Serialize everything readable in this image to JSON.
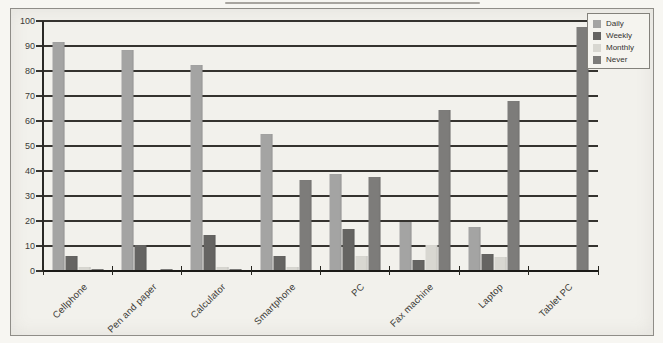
{
  "chart_data": {
    "type": "bar",
    "title": "",
    "xlabel": "",
    "ylabel": "",
    "categories": [
      "Cellphone",
      "Pen and paper",
      "Calculator",
      "Smartphone",
      "PC",
      "Fax machine",
      "Laptop",
      "Tablet PC"
    ],
    "series": [
      {
        "name": "Daily",
        "color": "#a4a4a3",
        "values": [
          91.5,
          88.5,
          82.5,
          55,
          39,
          19.5,
          17.5,
          0.5
        ]
      },
      {
        "name": "Weekly",
        "color": "#656462",
        "values": [
          6,
          10.5,
          14.5,
          6,
          17,
          4.5,
          7,
          0.5
        ]
      },
      {
        "name": "Monthly",
        "color": "#d8d7d1",
        "values": [
          1.5,
          0.5,
          1.5,
          1.5,
          6,
          10.5,
          5.5,
          0.5
        ]
      },
      {
        "name": "Never",
        "color": "#7d7c7a",
        "values": [
          1,
          1,
          1,
          36.5,
          37.5,
          64.5,
          68,
          97.5
        ]
      }
    ],
    "ylim": [
      0,
      100
    ],
    "yticks": [
      0,
      10,
      20,
      30,
      40,
      50,
      60,
      70,
      80,
      90,
      100
    ],
    "grid": true,
    "legend_position": "top-right",
    "legend_entries": [
      "Daily",
      "Weekly",
      "Monthly",
      "Never"
    ]
  },
  "style": {
    "paper_color": "#f7f6f2",
    "plot_background": "#f2f1ec",
    "grid_color": "#35332f",
    "axis_color": "#1c1b18",
    "frame_border": "#8f8d88",
    "text_color": "#3b3a37"
  }
}
